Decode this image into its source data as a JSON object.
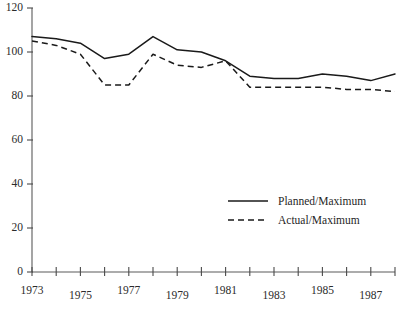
{
  "chart_data": {
    "type": "line",
    "title": "",
    "subtitle": "",
    "xlabel": "",
    "ylabel": "",
    "xlim": [
      1973,
      1988.5
    ],
    "ylim": [
      0,
      120
    ],
    "yticks": [
      0,
      20,
      40,
      60,
      80,
      100,
      120
    ],
    "ytick_labels": [
      "0",
      "20",
      "40",
      "60",
      "80",
      "100",
      "120"
    ],
    "xticks": [
      1973,
      1974,
      1975,
      1976,
      1977,
      1978,
      1979,
      1980,
      1981,
      1982,
      1983,
      1984,
      1985,
      1986,
      1987,
      1988
    ],
    "xtick_labels": [
      "1973",
      "",
      "1975",
      "",
      "1977",
      "",
      "1979",
      "",
      "1981",
      "",
      "1983",
      "",
      "1985",
      "",
      "1987",
      ""
    ],
    "x": [
      1973,
      1974,
      1975,
      1976,
      1977,
      1978,
      1979,
      1980,
      1981,
      1982,
      1983,
      1984,
      1985,
      1986,
      1987,
      1988
    ],
    "grid": false,
    "legend_position": "center-right",
    "series": [
      {
        "name": "Planned/Maximum",
        "style": "solid",
        "color": "#1a1a1a",
        "values": [
          107,
          106,
          104,
          97,
          99,
          107,
          101,
          100,
          96,
          89,
          88,
          88,
          90,
          89,
          87,
          90
        ]
      },
      {
        "name": "Actual/Maximum",
        "style": "dashed",
        "color": "#1a1a1a",
        "values": [
          105,
          103,
          99,
          85,
          85,
          99,
          94,
          93,
          96,
          84,
          84,
          84,
          84,
          83,
          83,
          82
        ]
      }
    ]
  },
  "legend": {
    "items": [
      {
        "label": "Planned/Maximum",
        "style": "solid"
      },
      {
        "label": "Actual/Maximum",
        "style": "dashed"
      }
    ]
  }
}
